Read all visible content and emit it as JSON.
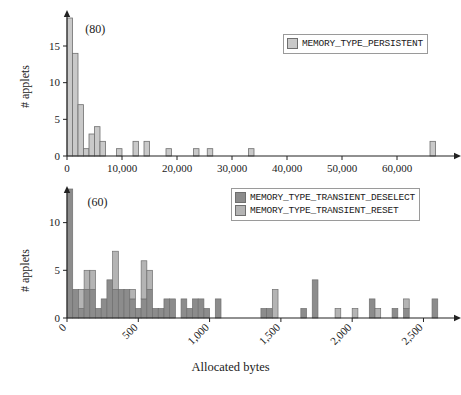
{
  "figure": {
    "xlabel": "Allocated bytes",
    "background": "#ffffff"
  },
  "colors": {
    "persistent": "#c9c9c9",
    "transient_deselect": "#8c8c8c",
    "transient_reset": "#b4b4b4",
    "bar_stroke": "#6f6f6f",
    "axis": "#222222",
    "text": "#1a1a1a"
  },
  "chart_data": [
    {
      "type": "bar",
      "id": "persistent-histogram",
      "title": "",
      "xlabel": "Allocated bytes",
      "ylabel": "# applets",
      "xlim": [
        0,
        70000
      ],
      "ylim": [
        0,
        18
      ],
      "grid": false,
      "legend_position": "top-right",
      "xticks": [
        0,
        10000,
        20000,
        30000,
        40000,
        50000,
        60000
      ],
      "xtick_labels": [
        "0",
        "10,000",
        "20,000",
        "30,000",
        "40,000",
        "50,000",
        "60,000"
      ],
      "yticks": [
        0,
        5,
        10,
        15
      ],
      "ytick_labels": [
        "0",
        "5",
        "10",
        "15"
      ],
      "annotations": [
        {
          "text": "(80)",
          "x": 1500,
          "y": 17,
          "note": "clipped bar true height 80"
        }
      ],
      "series": [
        {
          "name": "MEMORY_TYPE_PERSISTENT",
          "color": "#c9c9c9",
          "bin_width": 1000,
          "bars": [
            {
              "x": 500,
              "value": 80,
              "clipped": true
            },
            {
              "x": 1500,
              "value": 14
            },
            {
              "x": 2500,
              "value": 7
            },
            {
              "x": 3500,
              "value": 1
            },
            {
              "x": 4500,
              "value": 3
            },
            {
              "x": 5500,
              "value": 4
            },
            {
              "x": 6500,
              "value": 2
            },
            {
              "x": 9500,
              "value": 1
            },
            {
              "x": 12500,
              "value": 2
            },
            {
              "x": 14500,
              "value": 2
            },
            {
              "x": 18500,
              "value": 1
            },
            {
              "x": 23500,
              "value": 1
            },
            {
              "x": 26000,
              "value": 1
            },
            {
              "x": 33500,
              "value": 1
            },
            {
              "x": 66500,
              "value": 2
            }
          ]
        }
      ]
    },
    {
      "type": "bar",
      "id": "transient-histogram",
      "title": "",
      "xlabel": "Allocated bytes",
      "ylabel": "# applets",
      "xlim": [
        0,
        2700
      ],
      "ylim": [
        0,
        13
      ],
      "grid": false,
      "stacked": true,
      "legend_position": "top-right",
      "xticks": [
        0,
        500,
        1000,
        1500,
        2000,
        2500
      ],
      "xtick_labels": [
        "0",
        "500",
        "1,000",
        "1,500",
        "2,000",
        "2,500"
      ],
      "xtick_rotation": -45,
      "yticks": [
        0,
        5,
        10
      ],
      "ytick_labels": [
        "0",
        "5",
        "10"
      ],
      "annotations": [
        {
          "text": "(60)",
          "x": 60,
          "y": 12,
          "note": "clipped bar true height 60"
        }
      ],
      "series": [
        {
          "name": "MEMORY_TYPE_TRANSIENT_DESELECT",
          "color": "#8c8c8c",
          "bin_width": 40,
          "bars": [
            {
              "x": 20,
              "value": 60,
              "clipped": true
            },
            {
              "x": 60,
              "value": 3
            },
            {
              "x": 100,
              "value": 1
            },
            {
              "x": 140,
              "value": 3
            },
            {
              "x": 180,
              "value": 3
            },
            {
              "x": 220,
              "value": 1
            },
            {
              "x": 260,
              "value": 2
            },
            {
              "x": 300,
              "value": 4
            },
            {
              "x": 340,
              "value": 3
            },
            {
              "x": 380,
              "value": 3
            },
            {
              "x": 420,
              "value": 3
            },
            {
              "x": 460,
              "value": 2
            },
            {
              "x": 500,
              "value": 1
            },
            {
              "x": 540,
              "value": 2
            },
            {
              "x": 580,
              "value": 3
            },
            {
              "x": 620,
              "value": 1
            },
            {
              "x": 660,
              "value": 1
            },
            {
              "x": 700,
              "value": 2
            },
            {
              "x": 740,
              "value": 2
            },
            {
              "x": 820,
              "value": 2
            },
            {
              "x": 860,
              "value": 1
            },
            {
              "x": 900,
              "value": 2
            },
            {
              "x": 940,
              "value": 2
            },
            {
              "x": 980,
              "value": 1
            },
            {
              "x": 1060,
              "value": 2
            },
            {
              "x": 1380,
              "value": 1
            },
            {
              "x": 1420,
              "value": 1
            },
            {
              "x": 1660,
              "value": 1
            },
            {
              "x": 1740,
              "value": 4
            },
            {
              "x": 2140,
              "value": 2
            },
            {
              "x": 2300,
              "value": 1
            },
            {
              "x": 2380,
              "value": 1
            },
            {
              "x": 2580,
              "value": 2
            }
          ]
        },
        {
          "name": "MEMORY_TYPE_TRANSIENT_RESET",
          "color": "#b4b4b4",
          "bin_width": 40,
          "bars": [
            {
              "x": 60,
              "value": 0
            },
            {
              "x": 100,
              "value": 2
            },
            {
              "x": 140,
              "value": 2
            },
            {
              "x": 180,
              "value": 2
            },
            {
              "x": 260,
              "value": 0
            },
            {
              "x": 300,
              "value": 0
            },
            {
              "x": 340,
              "value": 4
            },
            {
              "x": 420,
              "value": 0
            },
            {
              "x": 460,
              "value": 1
            },
            {
              "x": 540,
              "value": 4
            },
            {
              "x": 580,
              "value": 2
            },
            {
              "x": 900,
              "value": 0
            },
            {
              "x": 1460,
              "value": 3
            },
            {
              "x": 1900,
              "value": 1
            },
            {
              "x": 2020,
              "value": 1
            },
            {
              "x": 2180,
              "value": 1
            },
            {
              "x": 2380,
              "value": 1
            }
          ]
        }
      ]
    }
  ],
  "panels": {
    "top": {
      "ylabel": "# applets",
      "overflow_note": "(80)",
      "legend": [
        {
          "label": "MEMORY_TYPE_PERSISTENT",
          "color": "#c9c9c9"
        }
      ]
    },
    "bottom": {
      "ylabel": "# applets",
      "overflow_note": "(60)",
      "legend": [
        {
          "label": "MEMORY_TYPE_TRANSIENT_DESELECT",
          "color": "#8c8c8c"
        },
        {
          "label": "MEMORY_TYPE_TRANSIENT_RESET",
          "color": "#b4b4b4"
        }
      ]
    }
  }
}
